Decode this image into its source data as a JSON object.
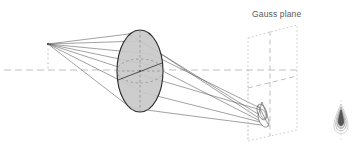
{
  "figure": {
    "title_visible": false,
    "background_color": "#ffffff",
    "width": 363,
    "height": 159
  },
  "labels": {
    "gauss_plane": "Gauss plane"
  },
  "colors": {
    "ray_stroke": "#555555",
    "lens_fill": "#c9c9c9",
    "lens_stroke": "#2b2b2b",
    "lens_inner_dash": "#8a8a8a",
    "axis_dash": "#b9b9b9",
    "plane_dotted": "#c2c2c2",
    "plane_dash": "#b5b5b5",
    "caustic_stroke": "#555555",
    "psf_dark": "#3a3a3a",
    "psf_mid": "#8e8e8e",
    "psf_light": "#c4c4c4",
    "text": "#5a5a5a"
  },
  "geometry": {
    "optical_axis": {
      "x1": 4,
      "y1": 70,
      "x2": 300,
      "y2": 70
    },
    "source_point": {
      "x": 48,
      "y": 44,
      "label": "off-axis-object-point"
    },
    "source_drop_line": {
      "x": 48,
      "y1": 44,
      "y2": 70
    },
    "lens": {
      "cx": 140,
      "cy": 71,
      "rx": 23,
      "ry": 41,
      "fill": "#c9c9c9"
    },
    "lens_inner_ellipses": [
      {
        "cx": 140,
        "cy": 71,
        "rx": 23,
        "ry": 13
      },
      {
        "cx": 140,
        "cy": 71,
        "rx": 9,
        "ry": 41
      }
    ],
    "rays": [
      {
        "from": [
          48,
          44
        ],
        "via": [
          129,
          34
        ],
        "to": [
          264,
          114
        ]
      },
      {
        "from": [
          48,
          44
        ],
        "via": [
          138,
          44
        ],
        "to": [
          268,
          123
        ]
      },
      {
        "from": [
          48,
          44
        ],
        "via": [
          150,
          56
        ],
        "to": [
          262,
          110
        ]
      },
      {
        "from": [
          48,
          44
        ],
        "via": [
          152,
          71
        ],
        "to": [
          266,
          119
        ]
      },
      {
        "from": [
          48,
          44
        ],
        "via": [
          146,
          92
        ],
        "to": [
          269,
          126
        ]
      },
      {
        "from": [
          48,
          44
        ],
        "via": [
          132,
          108
        ],
        "to": [
          267,
          122
        ]
      },
      {
        "from": [
          48,
          44
        ],
        "via": [
          160,
          66
        ],
        "to": [
          258,
          106
        ]
      }
    ],
    "caustic_cone": {
      "apex": [
        268,
        125
      ],
      "cap_center": [
        262,
        110
      ],
      "cap_rx": 4,
      "cap_ry": 8,
      "description": "comet-shaped caustic converging cone"
    },
    "gauss_plane": {
      "corners": [
        [
          248,
          38
        ],
        [
          297,
          25
        ],
        [
          297,
          130
        ],
        [
          248,
          141
        ]
      ],
      "style": "dotted-parallelogram",
      "cross_vertical": {
        "x1": 270,
        "y1": 31,
        "x2": 270,
        "y2": 136
      },
      "cross_horizontal": {
        "x1": 248,
        "y1": 88,
        "x2": 297,
        "y2": 76
      }
    },
    "psf_inset": {
      "cx": 341,
      "cy": 120,
      "shape": "teardrop-coma-point-spread-function",
      "arc_count": 4
    }
  }
}
